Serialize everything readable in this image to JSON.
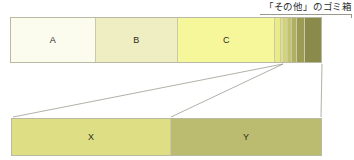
{
  "figure": {
    "title_text": "",
    "callout": {
      "label": "「その他」のゴミ箱",
      "leader_icon": "leader-line"
    },
    "colors": {
      "border": "#b9b9a4",
      "divider": "#c9c9ac",
      "leader_line": "#8f8f82",
      "text": "#2c2c22",
      "background": "#ffffff"
    }
  },
  "top_bar": {
    "name": "main-distribution-bar",
    "segments": [
      {
        "label": "A",
        "color": "#fbfbee",
        "width_pct": 27.3,
        "show_label": true
      },
      {
        "label": "B",
        "color": "#eeeec2",
        "width_pct": 26.6,
        "show_label": true
      },
      {
        "label": "C",
        "color": "#f6f69b",
        "width_pct": 31.4,
        "show_label": true
      },
      {
        "label": "",
        "color": "#eaea86",
        "width_pct": 1.8,
        "show_label": false
      },
      {
        "label": "",
        "color": "#e0e07e",
        "width_pct": 1.1,
        "show_label": false
      },
      {
        "label": "",
        "color": "#d3d378",
        "width_pct": 1.2,
        "show_label": false
      },
      {
        "label": "",
        "color": "#c3c36e",
        "width_pct": 1.4,
        "show_label": false
      },
      {
        "label": "",
        "color": "#b0b063",
        "width_pct": 1.6,
        "show_label": false
      },
      {
        "label": "",
        "color": "#9b9b56",
        "width_pct": 2.3,
        "show_label": false
      },
      {
        "label": "",
        "color": "#8a8a4b",
        "width_pct": 5.3,
        "show_label": false
      }
    ]
  },
  "bottom_bar": {
    "name": "expanded-detail-bar",
    "segments": [
      {
        "label": "X",
        "color": "#dede85",
        "width_pct": 51.5,
        "show_label": true
      },
      {
        "label": "Y",
        "color": "#bcbc70",
        "width_pct": 48.5,
        "show_label": true
      }
    ]
  },
  "chart_data": {
    "type": "bar",
    "orientation": "horizontal-stacked",
    "title": "「その他」のゴミ箱",
    "xlabel": "",
    "ylabel": "",
    "charts": [
      {
        "name": "top_bar",
        "categories": [
          "A",
          "B",
          "C",
          "s1",
          "s2",
          "s3",
          "s4",
          "s5",
          "s6",
          "s7"
        ],
        "values": [
          27.3,
          26.6,
          31.4,
          1.8,
          1.1,
          1.2,
          1.4,
          1.6,
          2.3,
          5.3
        ],
        "unit": "%",
        "total": 100
      },
      {
        "name": "bottom_bar_expanded",
        "categories": [
          "X",
          "Y"
        ],
        "values": [
          51.5,
          48.5
        ],
        "unit": "%",
        "total": 100
      }
    ],
    "legend": [],
    "annotations": [
      {
        "text": "「その他」のゴミ箱",
        "target": "top_bar_tail_segments"
      }
    ],
    "grid": false
  }
}
